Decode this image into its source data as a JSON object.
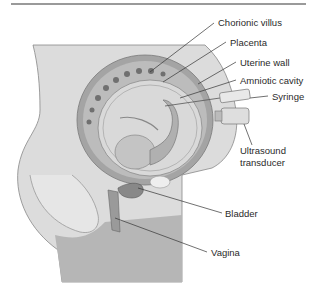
{
  "figure": {
    "labels": {
      "chorionic_villus": "Chorionic villus",
      "placenta": "Placenta",
      "uterine_wall": "Uterine wall",
      "amniotic_cavity": "Amniotic cavity",
      "syringe": "Syringe",
      "ultrasound_line1": "Ultrasound",
      "ultrasound_line2": "transducer",
      "bladder": "Bladder",
      "vagina": "Vagina"
    },
    "colors": {
      "body": "#c9c9c9",
      "body_light": "#e2e2e2",
      "uterus_wall": "#9e9e9e",
      "placenta": "#b4b4b4",
      "amniotic": "#dadada",
      "fetus": "#bdbdbd",
      "line": "#333333"
    }
  }
}
